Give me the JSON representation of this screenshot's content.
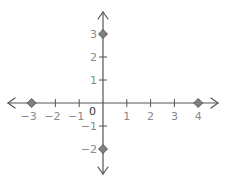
{
  "diagram": {
    "type": "coordinate-axes",
    "x_ticks": [
      -3,
      -2,
      -1,
      1,
      2,
      3,
      4
    ],
    "y_ticks": [
      3,
      2,
      1,
      -1,
      -2
    ],
    "origin_label": "0",
    "x_tick_labels": [
      "−3",
      "−2",
      "−1",
      "1",
      "2",
      "3",
      "4"
    ],
    "y_tick_labels": [
      "3",
      "2",
      "1",
      "−1",
      "−2"
    ],
    "points": [
      {
        "x": -3,
        "y": 0
      },
      {
        "x": 4,
        "y": 0
      },
      {
        "x": 0,
        "y": 3
      },
      {
        "x": 0,
        "y": -2
      }
    ],
    "marker_color": "#808080",
    "axis_color": "#555555",
    "label_color": "#8a8a8a"
  }
}
